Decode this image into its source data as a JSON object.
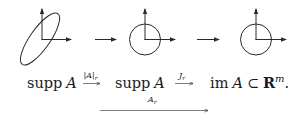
{
  "diagram": {
    "type": "commutative-mapping-diagram",
    "figures": [
      {
        "id": "fig-ellipse",
        "shape": "ellipse",
        "description": "tilted ellipse with coordinate axes"
      },
      {
        "id": "fig-circle-1",
        "shape": "circle",
        "description": "unit circle with coordinate axes"
      },
      {
        "id": "fig-circle-2",
        "shape": "circle",
        "description": "unit circle with coordinate axes"
      }
    ],
    "figure_arrows": 2,
    "row": {
      "space1": {
        "prefix": "supp",
        "var": "A"
      },
      "map1": {
        "bar_open": "|",
        "var": "A",
        "bar_close": "|",
        "sub": "r"
      },
      "space2": {
        "prefix": "supp",
        "var": "A"
      },
      "map2": {
        "var": "J",
        "sub": "r"
      },
      "space3": {
        "prefix": "im",
        "var": "A",
        "subset": "⊂",
        "field": "R",
        "sup": "m",
        "end": "."
      }
    },
    "composite": {
      "var": "A",
      "sub": "r"
    }
  },
  "colors": {
    "ink": "#2a2a2a",
    "background": "#ffffff"
  }
}
